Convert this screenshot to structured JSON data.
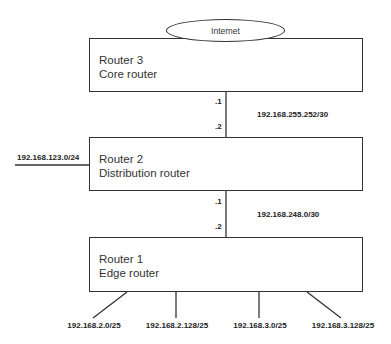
{
  "internet": {
    "label": "Internet"
  },
  "routers": [
    {
      "name": "Router 3",
      "role": "Core router"
    },
    {
      "name": "Router 2",
      "role": "Distribution router"
    },
    {
      "name": "Router 1",
      "role": "Edge router"
    }
  ],
  "links": {
    "r3_r2": {
      "network": "192.168.255.252/30",
      "upper_host": ".1",
      "lower_host": ".2"
    },
    "r2_r1": {
      "network": "192.168.248.0/30",
      "upper_host": ".1",
      "lower_host": ".2"
    },
    "r2_lan": {
      "network": "192.168.123.0/24"
    }
  },
  "edge_subnets": [
    "192.168.2.0/25",
    "192.168.2.128/25",
    "192.168.3.0/25",
    "192.168.3.128/25"
  ]
}
